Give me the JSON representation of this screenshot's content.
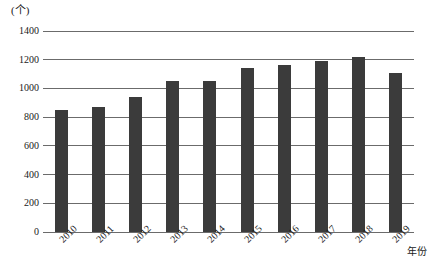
{
  "chart_data": {
    "type": "bar",
    "title": "",
    "subtitle": "",
    "xlabel": "年份",
    "ylabel": "(个)",
    "unit_label": "(个)",
    "categories": [
      "2010",
      "2011",
      "2012",
      "2013",
      "2014",
      "2015",
      "2016",
      "2017",
      "2018",
      "2019"
    ],
    "values": [
      850,
      870,
      940,
      1055,
      1055,
      1140,
      1165,
      1190,
      1220,
      1105
    ],
    "series": [
      {
        "name": "数量",
        "values": [
          850,
          870,
          940,
          1055,
          1055,
          1140,
          1165,
          1190,
          1220,
          1105
        ]
      }
    ],
    "ylim": [
      0,
      1400
    ],
    "ytick_values": [
      0,
      200,
      400,
      600,
      800,
      1000,
      1200,
      1400
    ],
    "ytick_labels": [
      "0",
      "200",
      "400",
      "600",
      "800",
      "1000",
      "1200",
      "1400"
    ],
    "grid": true,
    "grid_axis": "y",
    "legend": false,
    "legend_position": "none",
    "bar_color": "#3b3b3b",
    "grid_color": "#6b6b6b",
    "background": "#ffffff"
  }
}
